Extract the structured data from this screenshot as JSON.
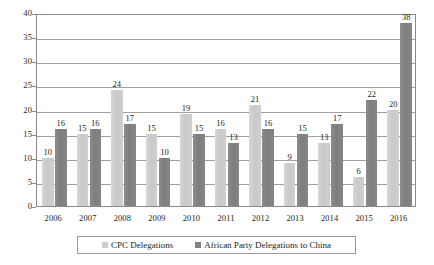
{
  "chart_data": {
    "type": "bar",
    "title": "",
    "subtitle": "",
    "xlabel": "",
    "ylabel": "",
    "ylim": [
      0,
      40
    ],
    "ytick_step": 5,
    "ytick_labels": [
      "0",
      "5",
      "10",
      "15",
      "20",
      "25",
      "30",
      "35",
      "40"
    ],
    "grid": true,
    "grid_axis": "y",
    "legend_position": "bottom",
    "categories": [
      "2006",
      "2007",
      "2008",
      "2009",
      "2010",
      "2011",
      "2012",
      "2013",
      "2014",
      "2015",
      "2016"
    ],
    "series": [
      {
        "name": "CPC Delegations",
        "color": "#cdcdcd",
        "values": [
          10,
          15,
          24,
          15,
          19,
          16,
          21,
          9,
          13,
          6,
          20
        ],
        "value_labels": [
          "10",
          "15",
          "24",
          "15",
          "19",
          "16",
          "21",
          "9",
          "13",
          "6",
          "20"
        ]
      },
      {
        "name": "African Party Delegations to China",
        "color": "#828282",
        "values": [
          16,
          16,
          17,
          10,
          15,
          13,
          16,
          15,
          17,
          22,
          38
        ],
        "value_labels": [
          "16",
          "16",
          "17",
          "10",
          "15",
          "13",
          "16",
          "15",
          "17",
          "22",
          "38"
        ]
      }
    ]
  },
  "legend": {
    "entries": [
      {
        "label": "CPC Delegations",
        "swatch_name": "legend-swatch-cpc-delegations"
      },
      {
        "label": "African Party Delegations to China",
        "swatch_name": "legend-swatch-african-party-delegations"
      }
    ]
  },
  "colors": {
    "series_a": "#cdcdcd",
    "series_b": "#828282",
    "gridline": "#a0a0a0",
    "frame": "#8a8a8a",
    "text": "#231f20",
    "background": "#ffffff"
  }
}
